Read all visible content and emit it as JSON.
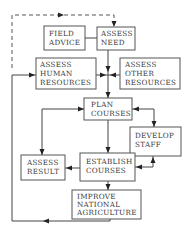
{
  "diagram": {
    "type": "flowchart",
    "nodes": [
      {
        "id": "field_advice",
        "lines": [
          "FIELD",
          "ADVICE"
        ]
      },
      {
        "id": "assess_need",
        "lines": [
          "ASSESS",
          "NEED"
        ]
      },
      {
        "id": "assess_human",
        "lines": [
          "ASSESS",
          "HUMAN",
          "RESOURCES"
        ]
      },
      {
        "id": "assess_other",
        "lines": [
          "ASSESS",
          "OTHER",
          "RESOURCES"
        ]
      },
      {
        "id": "plan_courses",
        "lines": [
          "PLAN",
          "COURSES"
        ]
      },
      {
        "id": "develop_staff",
        "lines": [
          "DEVELOP",
          "STAFF"
        ]
      },
      {
        "id": "assess_result",
        "lines": [
          "ASSESS",
          "RESULT"
        ]
      },
      {
        "id": "establish_courses",
        "lines": [
          "ESTABLISH",
          "COURSES"
        ]
      },
      {
        "id": "improve_agri",
        "lines": [
          "IMPROVE",
          "NATIONAL",
          "AGRICULTURE"
        ]
      }
    ],
    "edges": [
      {
        "from": "field_advice",
        "to": "assess_need",
        "style": "solid",
        "arrow": "none"
      },
      {
        "from": "assess_need",
        "to": "plan_courses",
        "style": "solid",
        "arrow": "forward"
      },
      {
        "from": "assess_human",
        "to": "plan_courses",
        "style": "solid",
        "arrow": "forward"
      },
      {
        "from": "assess_other",
        "to": "plan_courses",
        "style": "solid",
        "arrow": "forward"
      },
      {
        "from": "plan_courses",
        "to": "establish_courses",
        "style": "solid",
        "arrow": "forward"
      },
      {
        "from": "plan_courses",
        "to": "develop_staff",
        "style": "solid",
        "arrow": "both"
      },
      {
        "from": "develop_staff",
        "to": "establish_courses",
        "style": "solid",
        "arrow": "both"
      },
      {
        "from": "establish_courses",
        "to": "assess_result",
        "style": "solid",
        "arrow": "forward"
      },
      {
        "from": "assess_result",
        "to": "plan_courses",
        "style": "solid",
        "arrow": "forward"
      },
      {
        "from": "establish_courses",
        "to": "improve_agri",
        "style": "solid",
        "arrow": "forward"
      },
      {
        "from": "improve_agri",
        "to": "assess_human",
        "style": "solid",
        "arrow": "forward"
      },
      {
        "from": "improve_agri",
        "to": "assess_need",
        "style": "dashed",
        "arrow": "forward"
      }
    ]
  }
}
